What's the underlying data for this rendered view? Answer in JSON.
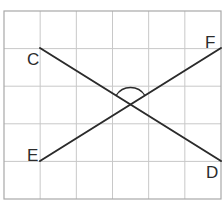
{
  "diagram": {
    "type": "geometry-grid",
    "grid": {
      "columns": 6,
      "rows": 5,
      "x0": 4,
      "y0": 11,
      "x1": 221,
      "y1": 199,
      "line_color": "#c8c8c8"
    },
    "points": {
      "C": {
        "x": 40,
        "y": 48,
        "label": "C",
        "label_x": 27,
        "label_y": 65
      },
      "D": {
        "x": 221,
        "y": 161,
        "label": "D",
        "label_x": 206,
        "label_y": 178
      },
      "E": {
        "x": 40,
        "y": 161,
        "label": "E",
        "label_x": 27,
        "label_y": 161
      },
      "F": {
        "x": 221,
        "y": 48,
        "label": "F",
        "label_x": 205,
        "label_y": 48
      }
    },
    "segments": [
      {
        "name": "CD",
        "from": "C",
        "to": "D"
      },
      {
        "name": "EF",
        "from": "E",
        "to": "F"
      }
    ],
    "angle_mark": {
      "label": "angle between CD and EF (upper)",
      "vertex": {
        "x": 130.5,
        "y": 104.5
      },
      "radius": 17
    },
    "line_color": "#2b2b2b"
  }
}
